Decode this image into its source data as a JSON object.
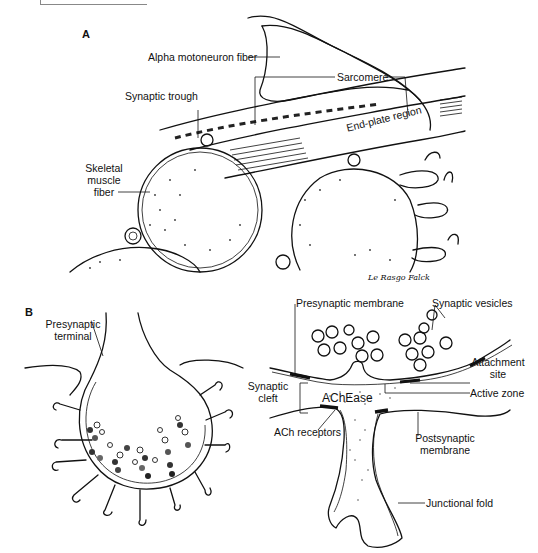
{
  "figure": {
    "panels": [
      {
        "id": "A",
        "label": "A",
        "title": "Neuromuscular junction overview",
        "annotations": [
          {
            "text": "Alpha motoneuron fiber",
            "target": "axon"
          },
          {
            "text": "Sarcomere",
            "target": "myofibril striations"
          },
          {
            "text": "Synaptic trough",
            "target": "end-plate trough"
          },
          {
            "text": "End-plate region",
            "target": "end-plate along fiber"
          },
          {
            "text": "Skeletal muscle fiber",
            "target": "muscle fiber cross-section"
          }
        ],
        "signature": "Le Rasgo Falck"
      },
      {
        "id": "B",
        "label": "B",
        "title": "Synapse detail",
        "annotations": [
          {
            "text": "Presynaptic terminal",
            "target": "terminal bulb"
          },
          {
            "text": "Presynaptic membrane",
            "target": "membrane"
          },
          {
            "text": "Synaptic vesicles",
            "target": "vesicles"
          },
          {
            "text": "Attachment site",
            "target": "membrane attachment"
          },
          {
            "text": "Active zone",
            "target": "release site"
          },
          {
            "text": "Synaptic cleft",
            "target": "cleft"
          },
          {
            "text": "AChEase",
            "target": "cleft enzyme"
          },
          {
            "text": "ACh receptors",
            "target": "postsynaptic receptors"
          },
          {
            "text": "Postsynaptic membrane",
            "target": "postsynaptic membrane"
          },
          {
            "text": "Junctional fold",
            "target": "fold"
          }
        ]
      }
    ]
  },
  "labels": {
    "panel_a": "A",
    "panel_b": "B",
    "alpha_motoneuron": "Alpha motoneuron fiber",
    "sarcomere": "Sarcomere",
    "synaptic_trough": "Synaptic trough",
    "end_plate": "End-plate region",
    "skeletal_line1": "Skeletal",
    "skeletal_line2": "muscle",
    "skeletal_line3": "fiber",
    "signature": "Le Rasgo Falck",
    "presyn_terminal_line1": "Presynaptic",
    "presyn_terminal_line2": "terminal",
    "presyn_membrane": "Presynaptic membrane",
    "synaptic_vesicles": "Synaptic vesicles",
    "attachment_line1": "Attachment",
    "attachment_line2": "site",
    "active_zone": "Active zone",
    "cleft_line1": "Synaptic",
    "cleft_line2": "cleft",
    "achease": "AChEase",
    "ach_receptors": "ACh receptors",
    "postsyn_line1": "Postsynaptic",
    "postsyn_line2": "membrane",
    "junctional_fold": "Junctional fold"
  }
}
